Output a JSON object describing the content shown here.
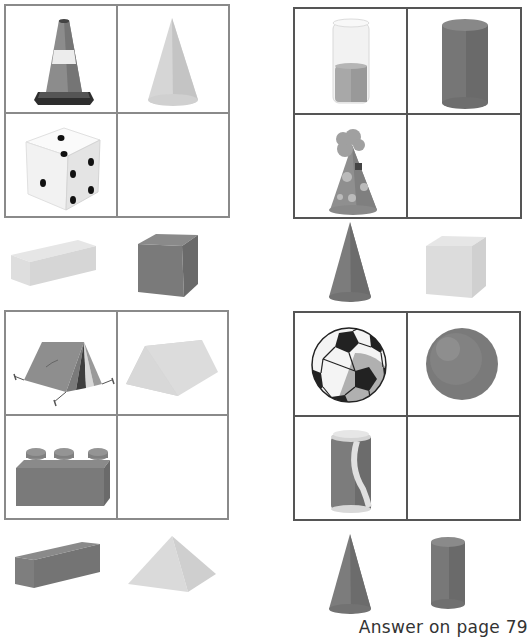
{
  "puzzles": [
    {
      "id": "puzzle-1",
      "grid": {
        "cells": [
          {
            "position": "top-left",
            "object": "traffic-cone"
          },
          {
            "position": "top-right",
            "object": "cone"
          },
          {
            "position": "bottom-left",
            "object": "die"
          },
          {
            "position": "bottom-right",
            "object": ""
          }
        ]
      },
      "options": [
        {
          "object": "cuboid",
          "shade": "light"
        },
        {
          "object": "cube",
          "shade": "dark"
        }
      ]
    },
    {
      "id": "puzzle-2",
      "grid": {
        "cells": [
          {
            "position": "top-left",
            "object": "glass-of-liquid"
          },
          {
            "position": "top-right",
            "object": "cylinder"
          },
          {
            "position": "bottom-left",
            "object": "party-hat"
          },
          {
            "position": "bottom-right",
            "object": ""
          }
        ]
      },
      "options": [
        {
          "object": "cone",
          "shade": "dark"
        },
        {
          "object": "cube",
          "shade": "light"
        }
      ]
    },
    {
      "id": "puzzle-3",
      "grid": {
        "cells": [
          {
            "position": "top-left",
            "object": "tent"
          },
          {
            "position": "top-right",
            "object": "triangular-prism"
          },
          {
            "position": "bottom-left",
            "object": "toy-brick"
          },
          {
            "position": "bottom-right",
            "object": ""
          }
        ]
      },
      "options": [
        {
          "object": "cuboid",
          "shade": "dark"
        },
        {
          "object": "square-pyramid",
          "shade": "light"
        }
      ]
    },
    {
      "id": "puzzle-4",
      "grid": {
        "cells": [
          {
            "position": "top-left",
            "object": "soccer-ball"
          },
          {
            "position": "top-right",
            "object": "sphere"
          },
          {
            "position": "bottom-left",
            "object": "soda-can"
          },
          {
            "position": "bottom-right",
            "object": ""
          }
        ]
      },
      "options": [
        {
          "object": "cone",
          "shade": "dark"
        },
        {
          "object": "cylinder",
          "shade": "dark"
        }
      ]
    }
  ],
  "footer": {
    "answer_text": "Answer on page 79"
  },
  "colors": {
    "grid_light": "#8a8a8a",
    "grid_dark": "#555555",
    "shape_dark": "#7a7a7a",
    "shape_light": "#dcdcdc"
  }
}
